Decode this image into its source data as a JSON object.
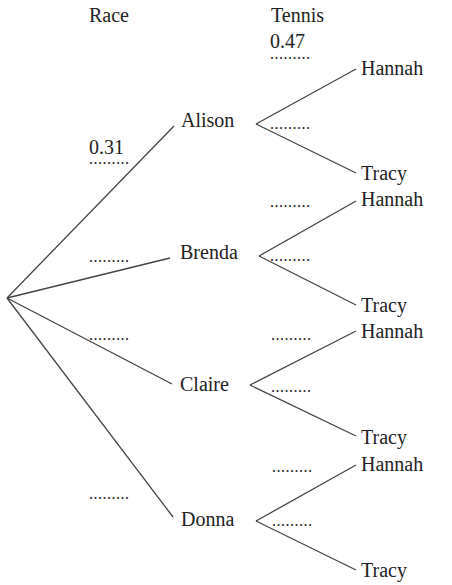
{
  "headers": {
    "race": "Race",
    "tennis": "Tennis"
  },
  "race_branches": [
    {
      "name": "Alison",
      "probability": "0.31"
    },
    {
      "name": "Brenda",
      "probability": "........."
    },
    {
      "name": "Claire",
      "probability": "........."
    },
    {
      "name": "Donna",
      "probability": "........."
    }
  ],
  "tennis_branches": [
    {
      "parent": "Alison",
      "hannah_label": "Hannah",
      "hannah_prob": "0.47",
      "hannah_blank": ".........",
      "tracy_label": "Tracy",
      "tracy_prob": "........."
    },
    {
      "parent": "Brenda",
      "hannah_label": "Hannah",
      "hannah_prob": ".........",
      "tracy_label": "Tracy",
      "tracy_prob": "........."
    },
    {
      "parent": "Claire",
      "hannah_label": "Hannah",
      "hannah_prob": ".........",
      "tracy_label": "Tracy",
      "tracy_prob": "........."
    },
    {
      "parent": "Donna",
      "hannah_label": "Hannah",
      "hannah_prob": ".........",
      "tracy_label": "Tracy",
      "tracy_prob": "........."
    }
  ],
  "race_blank": ".........",
  "colors": {
    "line": "#444444",
    "text": "#222222",
    "background": "#ffffff"
  }
}
